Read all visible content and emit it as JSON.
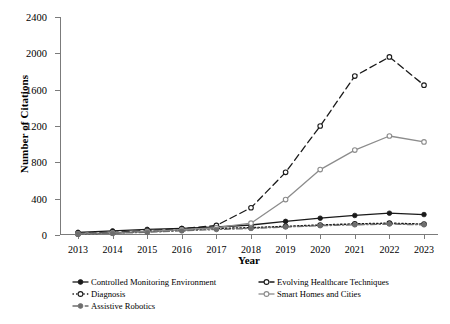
{
  "chart_data": {
    "type": "line",
    "title": "",
    "xlabel": "Year",
    "ylabel": "Number of Citations",
    "grid": false,
    "legend_position": "bottom",
    "categories": [
      2013,
      2014,
      2015,
      2016,
      2017,
      2018,
      2019,
      2020,
      2021,
      2022,
      2023
    ],
    "x_tick_labels": [
      "2013",
      "2014",
      "2015",
      "2016",
      "2017",
      "2018",
      "2019",
      "2020",
      "2021",
      "2022",
      "2023"
    ],
    "y_tick_labels": [
      "0",
      "400",
      "800",
      "1200",
      "1600",
      "2000",
      "2400"
    ],
    "y_ticks": [
      0,
      400,
      800,
      1200,
      1600,
      2000,
      2400
    ],
    "ylim": [
      0,
      2400
    ],
    "xlim": [
      2013,
      2023
    ],
    "series": [
      {
        "name": "Controlled Monitoring Environment",
        "color": "#1a1a1a",
        "line_style": "solid",
        "marker": "filled-circle",
        "values": [
          30,
          45,
          62,
          72,
          88,
          110,
          150,
          185,
          215,
          240,
          225
        ]
      },
      {
        "name": "Evolving Healthcare Techniques",
        "color": "#1a1a1a",
        "line_style": "dashed",
        "marker": "open-circle",
        "values": [
          18,
          30,
          48,
          70,
          105,
          300,
          690,
          1200,
          1750,
          1960,
          1650
        ]
      },
      {
        "name": "Diagnosis",
        "color": "#1a1a1a",
        "line_style": "dotted",
        "marker": "open-circle",
        "values": [
          12,
          22,
          38,
          55,
          72,
          80,
          95,
          110,
          122,
          130,
          120
        ]
      },
      {
        "name": "Smart Homes and Cities",
        "color": "#8c8c8c",
        "line_style": "solid",
        "marker": "open-circle",
        "values": [
          14,
          24,
          40,
          58,
          80,
          130,
          390,
          720,
          935,
          1090,
          1025
        ]
      },
      {
        "name": "Assistive Robotics",
        "color": "#6e6e6e",
        "line_style": "dash-dot",
        "marker": "filled-circle",
        "values": [
          10,
          18,
          30,
          45,
          60,
          72,
          88,
          102,
          112,
          120,
          112
        ]
      }
    ]
  },
  "legend": {
    "columns": [
      {
        "items": [
          {
            "label": "Controlled Monitoring Environment",
            "series_index": 0
          },
          {
            "label": "Diagnosis",
            "series_index": 2
          },
          {
            "label": "Assistive Robotics",
            "series_index": 4
          }
        ]
      },
      {
        "items": [
          {
            "label": "Evolving Healthcare Techniques",
            "series_index": 1
          },
          {
            "label": "Smart Homes and Cities",
            "series_index": 3
          }
        ]
      }
    ]
  }
}
